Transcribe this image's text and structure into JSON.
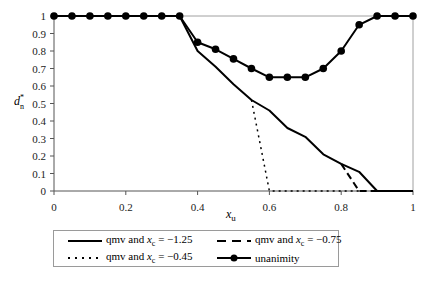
{
  "chart_data": {
    "type": "line",
    "title": "",
    "xlabel": "x_u",
    "ylabel": "d*_n",
    "xlim": [
      0,
      1
    ],
    "ylim": [
      0,
      1
    ],
    "xticks": [
      "0",
      "0.2",
      "0.4",
      "0.6",
      "0.8",
      "1"
    ],
    "yticks": [
      "0",
      "0.1",
      "0.2",
      "0.3",
      "0.4",
      "0.5",
      "0.6",
      "0.7",
      "0.8",
      "0.9",
      "1"
    ],
    "grid": false,
    "legend_position": "bottom",
    "series": [
      {
        "name": "qmv and x_c = −1.25",
        "style": "solid",
        "x": [
          0,
          0.05,
          0.1,
          0.15,
          0.2,
          0.25,
          0.3,
          0.35,
          0.4,
          0.45,
          0.5,
          0.55,
          0.6,
          0.65,
          0.7,
          0.75,
          0.8,
          0.85,
          0.9,
          0.95,
          1
        ],
        "y": [
          1,
          1,
          1,
          1,
          1,
          1,
          1,
          1,
          0.8,
          0.71,
          0.61,
          0.52,
          0.46,
          0.36,
          0.31,
          0.21,
          0.155,
          0.11,
          0,
          0,
          0
        ]
      },
      {
        "name": "qmv and x_c = −0.75",
        "style": "dashed",
        "x": [
          0.8,
          0.85,
          0.9,
          0.95,
          1
        ],
        "y": [
          0.155,
          0,
          0,
          0,
          0
        ]
      },
      {
        "name": "qmv and x_c = −0.45",
        "style": "dotted",
        "x": [
          0.55,
          0.6,
          0.65,
          0.7,
          0.75,
          0.8,
          0.85
        ],
        "y": [
          0.52,
          0,
          0,
          0,
          0,
          0,
          0
        ]
      },
      {
        "name": "unanimity",
        "style": "solid-marker",
        "x": [
          0,
          0.05,
          0.1,
          0.15,
          0.2,
          0.25,
          0.3,
          0.35,
          0.4,
          0.45,
          0.5,
          0.55,
          0.6,
          0.65,
          0.7,
          0.75,
          0.8,
          0.85,
          0.9,
          0.95,
          1
        ],
        "y": [
          1,
          1,
          1,
          1,
          1,
          1,
          1,
          1,
          0.85,
          0.81,
          0.755,
          0.7,
          0.65,
          0.65,
          0.65,
          0.7,
          0.8,
          0.95,
          1,
          1,
          1
        ]
      }
    ]
  },
  "legend": {
    "items": [
      {
        "prefix": "qmv and ",
        "var": "x",
        "sub": "c",
        "suffix": " = −1.25",
        "style": "solid"
      },
      {
        "prefix": "qmv and ",
        "var": "x",
        "sub": "c",
        "suffix": " = −0.75",
        "style": "dashed"
      },
      {
        "prefix": "qmv and ",
        "var": "x",
        "sub": "c",
        "suffix": " = −0.45",
        "style": "dotted"
      },
      {
        "prefix": "unanimity",
        "var": "",
        "sub": "",
        "suffix": "",
        "style": "solid-marker"
      }
    ]
  },
  "axes": {
    "xlabel_main": "x",
    "xlabel_sub": "u",
    "ylabel_main": "d",
    "ylabel_sup": "*",
    "ylabel_sub": "n"
  }
}
